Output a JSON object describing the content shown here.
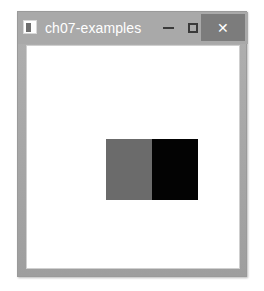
{
  "window": {
    "title": "ch07-examples",
    "icon_name": "app-image-icon",
    "frame_color": "#a8a8a8",
    "titlebar_color": "#a9a9a9",
    "title_text_color": "#ffffff",
    "client_background": "#ffffff"
  },
  "controls": {
    "minimize": {
      "label": "–",
      "name": "minimize-button"
    },
    "maximize": {
      "label": "☐",
      "name": "maximize-button"
    },
    "close": {
      "label": "✕",
      "name": "close-button",
      "background": "#7c7c7c",
      "glyph_color": "#ffffff"
    }
  },
  "content": {
    "image": {
      "name": "split-gray-black-image",
      "width_px": 92,
      "height_px": 61,
      "left_half_color": "#6b6b6b",
      "right_half_color": "#030303",
      "split_fraction": 0.5
    }
  }
}
